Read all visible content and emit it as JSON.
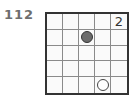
{
  "puzzle": {
    "number": "112",
    "rows": 5,
    "cols": 5,
    "cells": [
      [
        "",
        "",
        "",
        "",
        "2"
      ],
      [
        "",
        "",
        "black",
        "",
        ""
      ],
      [
        "",
        "",
        "",
        "",
        ""
      ],
      [
        "",
        "",
        "",
        "",
        ""
      ],
      [
        "",
        "",
        "",
        "white",
        ""
      ]
    ],
    "clues": [
      {
        "row": 0,
        "col": 4,
        "type": "number",
        "value": "2"
      },
      {
        "row": 1,
        "col": 2,
        "type": "black-circle"
      },
      {
        "row": 4,
        "col": 3,
        "type": "white-circle"
      }
    ]
  }
}
